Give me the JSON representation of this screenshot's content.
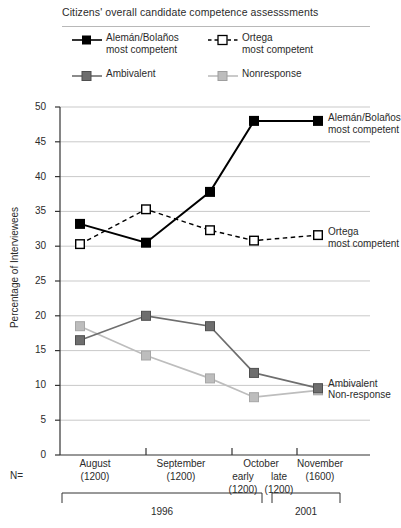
{
  "chart_data": {
    "type": "line",
    "title": "Citizens' overall candidate competence assesssments",
    "xlabel": "",
    "ylabel": "Percentage of Interviewees",
    "ylim": [
      0,
      50
    ],
    "yticks": [
      0,
      5,
      10,
      15,
      20,
      25,
      30,
      35,
      40,
      45,
      50
    ],
    "grid": true,
    "legend_position": "top",
    "categories": [
      "August",
      "September",
      "October early",
      "October late",
      "November"
    ],
    "series": [
      {
        "name": "Alemán/Bolaños most competent",
        "values": [
          33.2,
          30.5,
          37.8,
          48.0,
          48.0
        ],
        "color": "#000000",
        "marker": "filled-square",
        "line": "solid"
      },
      {
        "name": "Ortega most competent",
        "values": [
          30.3,
          35.3,
          32.3,
          30.8,
          31.6
        ],
        "color": "#000000",
        "marker": "open-square",
        "line": "dashed"
      },
      {
        "name": "Ambivalent",
        "values": [
          16.5,
          20.0,
          18.5,
          11.8,
          9.6
        ],
        "color": "#6e6e6e",
        "marker": "filled-square",
        "line": "solid"
      },
      {
        "name": "Nonresponse",
        "values": [
          18.5,
          14.3,
          11.0,
          8.3,
          9.3
        ],
        "color": "#bdbdbd",
        "marker": "filled-square",
        "line": "solid"
      }
    ],
    "annotations": [
      {
        "text_line1": "Alemán/Bolaños",
        "text_line2": "most competent"
      },
      {
        "text_line1": "Ortega",
        "text_line2": "most competent"
      },
      {
        "text_line1": "Ambivalent",
        "text_line2": ""
      },
      {
        "text_line1": "Non-response",
        "text_line2": ""
      }
    ]
  },
  "legend": {
    "entries": [
      {
        "line1": "Alemán/Bolaños",
        "line2": "most competent"
      },
      {
        "line1": "Ortega",
        "line2": "most competent"
      },
      {
        "line1": "Ambivalent",
        "line2": ""
      },
      {
        "line1": "Nonresponse",
        "line2": ""
      }
    ]
  },
  "yaxis": {
    "label": "Percentage of Interviewees",
    "ticks": [
      "50",
      "45",
      "40",
      "35",
      "30",
      "25",
      "20",
      "15",
      "10",
      "5",
      "0"
    ]
  },
  "xaxis": {
    "n_prefix": "N=",
    "groups": [
      {
        "month": "August",
        "sub1": "",
        "sub2": "",
        "n1": "(1200)",
        "n2": ""
      },
      {
        "month": "September",
        "sub1": "",
        "sub2": "",
        "n1": "(1200)",
        "n2": ""
      },
      {
        "month": "October",
        "sub1": "early",
        "sub2": "late",
        "n1": "(1200)",
        "n2": "(1200)"
      },
      {
        "month": "November",
        "sub1": "",
        "sub2": "",
        "n1": "(1600)",
        "n2": ""
      }
    ],
    "years": [
      {
        "label": "1996"
      },
      {
        "label": "2001"
      }
    ]
  },
  "annotations": {
    "aleman_l1": "Alemán/Bolaños",
    "aleman_l2": "most competent",
    "ortega_l1": "Ortega",
    "ortega_l2": "most competent",
    "ambivalent": "Ambivalent",
    "nonresponse": "Non-response"
  },
  "colors": {
    "aleman": "#000000",
    "ortega": "#000000",
    "ambivalent": "#6e6e6e",
    "nonresponse": "#bdbdbd",
    "grid": "#c9c9c9",
    "axis": "#333333"
  }
}
